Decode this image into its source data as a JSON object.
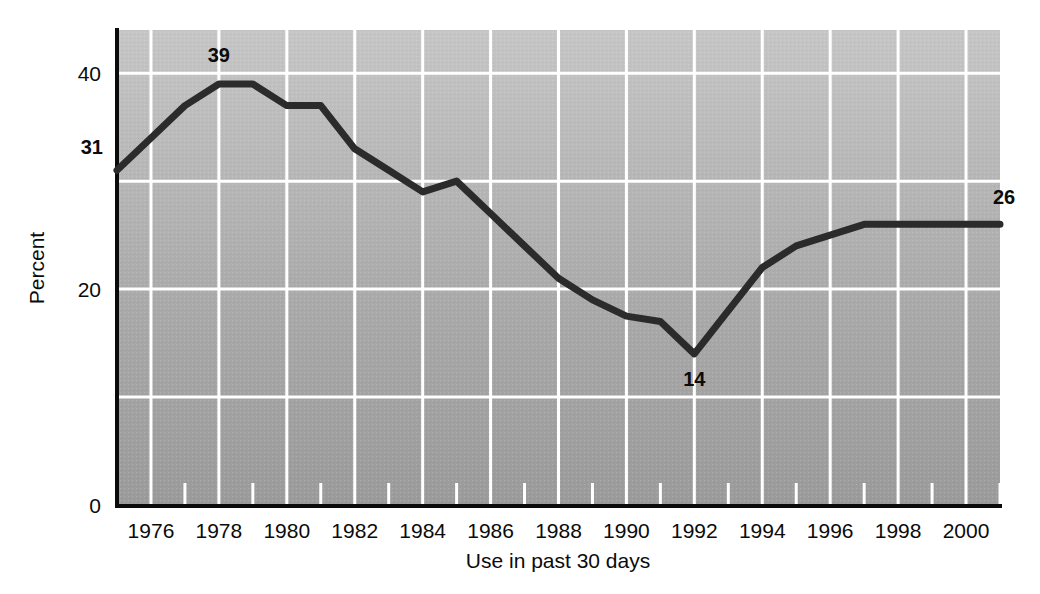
{
  "chart_data": {
    "type": "line",
    "title": "",
    "subtitle": "",
    "xlabel": "Use in past 30 days",
    "ylabel": "Percent",
    "xlim": [
      1975,
      2001
    ],
    "ylim": [
      0,
      44
    ],
    "grid": true,
    "legend": null,
    "y_tick_labels": [
      "0",
      "20",
      "40"
    ],
    "y_ticks": [
      0,
      20,
      40
    ],
    "y_gridlines": [
      10,
      20,
      30,
      40
    ],
    "x_tick_labels": [
      "1976",
      "1978",
      "1980",
      "1982",
      "1984",
      "1986",
      "1988",
      "1990",
      "1992",
      "1994",
      "1996",
      "1998",
      "2000"
    ],
    "x_major_ticks": [
      1976,
      1978,
      1980,
      1982,
      1984,
      1986,
      1988,
      1990,
      1992,
      1994,
      1996,
      1998,
      2000
    ],
    "x_minor_ticks": [
      1975,
      1977,
      1979,
      1981,
      1983,
      1985,
      1987,
      1989,
      1991,
      1993,
      1995,
      1997,
      1999,
      2001
    ],
    "x": [
      1975,
      1976,
      1977,
      1978,
      1979,
      1980,
      1981,
      1982,
      1983,
      1984,
      1985,
      1986,
      1987,
      1988,
      1989,
      1990,
      1991,
      1992,
      1993,
      1994,
      1995,
      1996,
      1997,
      1998,
      1999,
      2000,
      2001
    ],
    "values": [
      31,
      34,
      37,
      39,
      39,
      37,
      37,
      33,
      31,
      29,
      30,
      27,
      24,
      21,
      19,
      17.5,
      17,
      14,
      18,
      22,
      24,
      25,
      26,
      26,
      26,
      26,
      26
    ],
    "annotations": [
      {
        "label": "31",
        "x": 1975,
        "y": 31
      },
      {
        "label": "39",
        "x": 1978,
        "y": 39
      },
      {
        "label": "14",
        "x": 1992,
        "y": 14
      },
      {
        "label": "26",
        "x": 2001,
        "y": 26
      }
    ],
    "colors": {
      "line": "#2b2b2b",
      "plot_background_top": "#c2c2c2",
      "plot_background_bottom": "#9e9e9e",
      "gridline": "#ffffff",
      "axis": "#0b0b0b",
      "text": "#0b0b0b"
    }
  }
}
